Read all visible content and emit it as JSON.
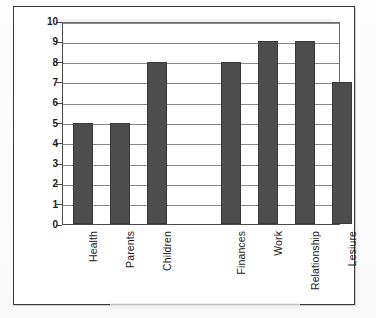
{
  "chart_data": {
    "type": "bar",
    "title": "",
    "subtitle": "",
    "xlabel": "",
    "ylabel": "",
    "categories": [
      "Health",
      "Parents",
      "Children",
      "Finances",
      "Work",
      "Relationship",
      "Lesiure"
    ],
    "values": [
      5,
      5,
      8,
      8,
      9,
      9,
      7
    ],
    "ylim": [
      0,
      10
    ],
    "ytick_labels": [
      "10",
      "9",
      "8",
      "7",
      "6",
      "5",
      "4",
      "3",
      "2",
      "1",
      "0"
    ],
    "ytick_values": [
      10,
      9,
      8,
      7,
      6,
      5,
      4,
      3,
      2,
      1,
      0
    ],
    "grid": true,
    "legend": false,
    "legend_position": "none",
    "orientation": "vertical",
    "bar_color": "#4d4d4d",
    "gridline_color": "#8a8a8a",
    "axis_color": "#4a4a4a",
    "plot_background": "#ffffff",
    "gap_after_category_index": 2
  }
}
